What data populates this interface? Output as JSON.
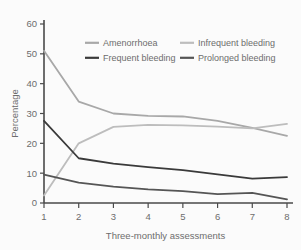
{
  "chart_data": {
    "type": "line",
    "title": "",
    "xlabel": "Three-monthly assessments",
    "ylabel": "Percentage",
    "x": [
      1,
      2,
      3,
      4,
      5,
      6,
      7,
      8
    ],
    "xticklabels": [
      "1",
      "2",
      "3",
      "4",
      "5",
      "6",
      "7",
      "8"
    ],
    "yticklabels": [
      "0",
      "10",
      "20",
      "30",
      "40",
      "50",
      "60"
    ],
    "yticks": [
      0,
      10,
      20,
      30,
      40,
      50,
      60
    ],
    "xlim": [
      1,
      8
    ],
    "ylim": [
      0,
      60
    ],
    "grid": false,
    "legend_position": "top-inside",
    "series": [
      {
        "name": "Amenorrhoea",
        "color": "#a8a8a8",
        "width": 1.8,
        "values": [
          51.0,
          34.0,
          30.0,
          29.2,
          29.0,
          27.5,
          25.2,
          22.5
        ]
      },
      {
        "name": "Infrequent bleeding",
        "color": "#bdbdbd",
        "width": 1.8,
        "values": [
          2.5,
          20.0,
          25.5,
          26.2,
          26.0,
          25.6,
          25.0,
          26.5
        ]
      },
      {
        "name": "Frequent bleeding",
        "color": "#3a3a3a",
        "width": 1.8,
        "values": [
          27.5,
          15.0,
          13.2,
          12.0,
          11.0,
          9.6,
          8.2,
          8.7
        ]
      },
      {
        "name": "Prolonged bleeding",
        "color": "#555555",
        "width": 1.8,
        "values": [
          9.5,
          6.8,
          5.5,
          4.6,
          4.0,
          3.0,
          3.4,
          1.2
        ]
      }
    ],
    "legend_entries": [
      {
        "label": "Amenorrhoea",
        "color": "#a8a8a8",
        "col": 0,
        "row": 0
      },
      {
        "label": "Infrequent bleeding",
        "color": "#bdbdbd",
        "col": 1,
        "row": 0
      },
      {
        "label": "Frequent bleeding",
        "color": "#3a3a3a",
        "col": 0,
        "row": 1
      },
      {
        "label": "Prolonged bleeding",
        "color": "#555555",
        "col": 1,
        "row": 1
      }
    ]
  },
  "colors": {
    "background": "#fbfbfb",
    "axis": "#4a4a4a",
    "text": "#6d6d6d"
  }
}
